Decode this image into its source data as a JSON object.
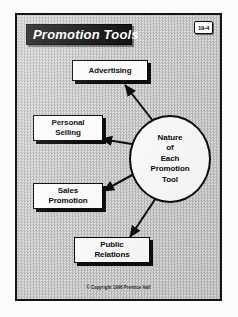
{
  "slide": {
    "title": "Promotion Tools",
    "page_badge": "19-4",
    "copyright": "© Copyright 1996 Prentice Hall"
  },
  "diagram": {
    "type": "hub-and-spoke",
    "center": {
      "name": "nature-of-each-promotion-tool",
      "lines": [
        "Nature",
        "of",
        "Each",
        "Promotion",
        "Tool"
      ],
      "text": "Nature of Each Promotion Tool"
    },
    "nodes": [
      {
        "name": "advertising",
        "lines": [
          "Advertising"
        ],
        "text": "Advertising"
      },
      {
        "name": "personal-selling",
        "lines": [
          "Personal",
          "Selling"
        ],
        "text": "Personal Selling"
      },
      {
        "name": "sales-promotion",
        "lines": [
          "Sales",
          "Promotion"
        ],
        "text": "Sales Promotion"
      },
      {
        "name": "public-relations",
        "lines": [
          "Public",
          "Relations"
        ],
        "text": "Public Relations"
      }
    ],
    "connectors": [
      {
        "from": "center",
        "to": "advertising"
      },
      {
        "from": "center",
        "to": "personal-selling"
      },
      {
        "from": "center",
        "to": "sales-promotion"
      },
      {
        "from": "center",
        "to": "public-relations"
      }
    ]
  },
  "colors": {
    "frame": "#141414",
    "background": "#cfcfcf",
    "banner": "#111111",
    "banner_text": "#ffffff",
    "box_fill": "#fbfbfb",
    "ink": "#0d0d0d"
  }
}
